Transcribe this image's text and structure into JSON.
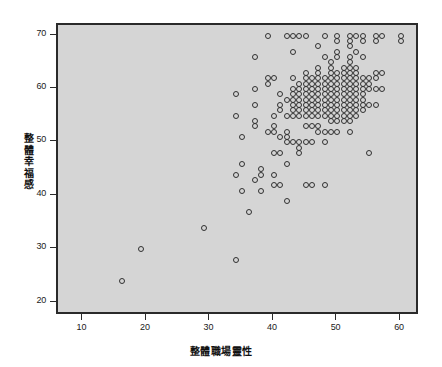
{
  "chart_data": {
    "type": "scatter",
    "title": "",
    "xlabel": "整體職場靈性",
    "ylabel": "整體幸福感",
    "xlim": [
      6,
      63
    ],
    "ylim": [
      17.5,
      72
    ],
    "xticks": [
      10,
      20,
      30,
      40,
      50,
      60
    ],
    "yticks": [
      20,
      30,
      40,
      50,
      60,
      70
    ],
    "grid": false,
    "legend": null,
    "marker": "open-circle",
    "marker_color": "#303030",
    "plot_background": "#d5d5d5",
    "frame_color": "#2a2a2a",
    "points": [
      [
        16,
        24
      ],
      [
        19,
        30
      ],
      [
        29,
        34
      ],
      [
        34,
        28
      ],
      [
        34,
        59
      ],
      [
        34,
        55
      ],
      [
        34,
        44
      ],
      [
        35,
        51
      ],
      [
        35,
        46
      ],
      [
        35,
        41
      ],
      [
        36,
        37
      ],
      [
        37,
        60
      ],
      [
        37,
        57
      ],
      [
        37,
        54
      ],
      [
        37,
        53
      ],
      [
        37,
        66
      ],
      [
        37,
        43
      ],
      [
        38,
        44
      ],
      [
        38,
        45
      ],
      [
        38,
        41
      ],
      [
        39,
        70
      ],
      [
        39,
        62
      ],
      [
        39,
        61
      ],
      [
        39,
        52
      ],
      [
        40,
        62
      ],
      [
        40,
        55
      ],
      [
        40,
        53
      ],
      [
        40,
        52
      ],
      [
        40,
        48
      ],
      [
        40,
        44
      ],
      [
        40,
        42
      ],
      [
        41,
        59
      ],
      [
        41,
        57
      ],
      [
        41,
        56
      ],
      [
        41,
        51
      ],
      [
        41,
        48
      ],
      [
        41,
        42
      ],
      [
        42,
        70
      ],
      [
        42,
        58
      ],
      [
        42,
        55
      ],
      [
        42,
        52
      ],
      [
        42,
        51
      ],
      [
        42,
        50
      ],
      [
        42,
        46
      ],
      [
        42,
        39
      ],
      [
        43,
        70
      ],
      [
        43,
        67
      ],
      [
        43,
        62
      ],
      [
        43,
        60
      ],
      [
        43,
        59
      ],
      [
        43,
        58
      ],
      [
        43,
        57
      ],
      [
        43,
        56
      ],
      [
        43,
        55
      ],
      [
        43,
        50
      ],
      [
        44,
        70
      ],
      [
        44,
        61
      ],
      [
        44,
        60
      ],
      [
        44,
        59
      ],
      [
        44,
        58
      ],
      [
        44,
        57
      ],
      [
        44,
        56
      ],
      [
        44,
        55
      ],
      [
        44,
        50
      ],
      [
        44,
        49
      ],
      [
        44,
        48
      ],
      [
        45,
        70
      ],
      [
        45,
        63
      ],
      [
        45,
        62
      ],
      [
        45,
        61
      ],
      [
        45,
        60
      ],
      [
        45,
        59
      ],
      [
        45,
        58
      ],
      [
        45,
        57
      ],
      [
        45,
        56
      ],
      [
        45,
        55
      ],
      [
        45,
        53
      ],
      [
        45,
        50
      ],
      [
        45,
        42
      ],
      [
        46,
        62
      ],
      [
        46,
        61
      ],
      [
        46,
        60
      ],
      [
        46,
        59
      ],
      [
        46,
        58
      ],
      [
        46,
        57
      ],
      [
        46,
        56
      ],
      [
        46,
        55
      ],
      [
        46,
        53
      ],
      [
        46,
        50
      ],
      [
        46,
        42
      ],
      [
        47,
        68
      ],
      [
        47,
        64
      ],
      [
        47,
        63
      ],
      [
        47,
        62
      ],
      [
        47,
        61
      ],
      [
        47,
        60
      ],
      [
        47,
        59
      ],
      [
        47,
        58
      ],
      [
        47,
        57
      ],
      [
        47,
        56
      ],
      [
        47,
        55
      ],
      [
        47,
        53
      ],
      [
        47,
        52
      ],
      [
        48,
        70
      ],
      [
        48,
        66
      ],
      [
        48,
        62
      ],
      [
        48,
        61
      ],
      [
        48,
        60
      ],
      [
        48,
        59
      ],
      [
        48,
        58
      ],
      [
        48,
        57
      ],
      [
        48,
        56
      ],
      [
        48,
        55
      ],
      [
        48,
        52
      ],
      [
        48,
        50
      ],
      [
        48,
        42
      ],
      [
        49,
        65
      ],
      [
        49,
        64
      ],
      [
        49,
        63
      ],
      [
        49,
        62
      ],
      [
        49,
        61
      ],
      [
        49,
        60
      ],
      [
        49,
        59
      ],
      [
        49,
        58
      ],
      [
        49,
        57
      ],
      [
        49,
        56
      ],
      [
        49,
        55
      ],
      [
        49,
        54
      ],
      [
        49,
        52
      ],
      [
        50,
        70
      ],
      [
        50,
        69
      ],
      [
        50,
        67
      ],
      [
        50,
        66
      ],
      [
        50,
        63
      ],
      [
        50,
        62
      ],
      [
        50,
        61
      ],
      [
        50,
        60
      ],
      [
        50,
        59
      ],
      [
        50,
        58
      ],
      [
        50,
        57
      ],
      [
        50,
        56
      ],
      [
        50,
        55
      ],
      [
        50,
        54
      ],
      [
        50,
        52
      ],
      [
        51,
        64
      ],
      [
        51,
        63
      ],
      [
        51,
        62
      ],
      [
        51,
        61
      ],
      [
        51,
        60
      ],
      [
        51,
        59
      ],
      [
        51,
        58
      ],
      [
        51,
        57
      ],
      [
        51,
        56
      ],
      [
        51,
        55
      ],
      [
        51,
        54
      ],
      [
        52,
        70
      ],
      [
        52,
        69
      ],
      [
        52,
        68
      ],
      [
        52,
        66
      ],
      [
        52,
        65
      ],
      [
        52,
        64
      ],
      [
        52,
        63
      ],
      [
        52,
        62
      ],
      [
        52,
        61
      ],
      [
        52,
        60
      ],
      [
        52,
        59
      ],
      [
        52,
        58
      ],
      [
        52,
        57
      ],
      [
        52,
        56
      ],
      [
        52,
        55
      ],
      [
        52,
        54
      ],
      [
        52,
        52
      ],
      [
        53,
        70
      ],
      [
        53,
        67
      ],
      [
        53,
        64
      ],
      [
        53,
        63
      ],
      [
        53,
        62
      ],
      [
        53,
        61
      ],
      [
        53,
        60
      ],
      [
        53,
        59
      ],
      [
        53,
        58
      ],
      [
        53,
        57
      ],
      [
        53,
        56
      ],
      [
        53,
        55
      ],
      [
        54,
        70
      ],
      [
        54,
        69
      ],
      [
        54,
        66
      ],
      [
        54,
        62
      ],
      [
        54,
        61
      ],
      [
        54,
        60
      ],
      [
        54,
        59
      ],
      [
        54,
        58
      ],
      [
        54,
        57
      ],
      [
        54,
        56
      ],
      [
        55,
        62
      ],
      [
        55,
        61
      ],
      [
        55,
        60
      ],
      [
        55,
        57
      ],
      [
        55,
        48
      ],
      [
        56,
        70
      ],
      [
        56,
        69
      ],
      [
        56,
        63
      ],
      [
        56,
        62
      ],
      [
        56,
        60
      ],
      [
        56,
        57
      ],
      [
        57,
        70
      ],
      [
        57,
        63
      ],
      [
        57,
        60
      ],
      [
        60,
        70
      ],
      [
        60,
        69
      ]
    ]
  }
}
